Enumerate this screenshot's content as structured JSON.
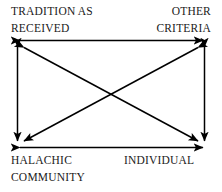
{
  "diagram": {
    "background_color": "#ffffff",
    "line_color": "#000000",
    "text_color": "#1a1a1a",
    "nodes": [
      {
        "id": "tradition-as-received",
        "position": "top-left",
        "line1": "TRADITION AS",
        "line2": "RECEIVED"
      },
      {
        "id": "other-criteria",
        "position": "top-right",
        "line1": "OTHER",
        "line2": "CRITERIA"
      },
      {
        "id": "halachic-community",
        "position": "bottom-left",
        "line1": "HALACHIC",
        "line2": "COMMUNITY"
      },
      {
        "id": "individual",
        "position": "bottom-right",
        "line1": "INDIVIDUAL",
        "line2": ""
      }
    ],
    "connectors": [
      {
        "id": "top-edge",
        "from": "tradition-as-received",
        "to": "other-criteria",
        "style": "double-headed-arrow"
      },
      {
        "id": "bottom-edge",
        "from": "halachic-community",
        "to": "individual",
        "style": "double-headed-arrow"
      },
      {
        "id": "left-edge",
        "from": "tradition-as-received",
        "to": "halachic-community",
        "style": "double-headed-arrow"
      },
      {
        "id": "right-edge",
        "from": "other-criteria",
        "to": "individual",
        "style": "double-headed-arrow"
      },
      {
        "id": "diagonal-tl-br",
        "from": "tradition-as-received",
        "to": "individual",
        "style": "double-headed-arrow"
      },
      {
        "id": "diagonal-tr-bl",
        "from": "other-criteria",
        "to": "halachic-community",
        "style": "double-headed-arrow"
      }
    ]
  }
}
